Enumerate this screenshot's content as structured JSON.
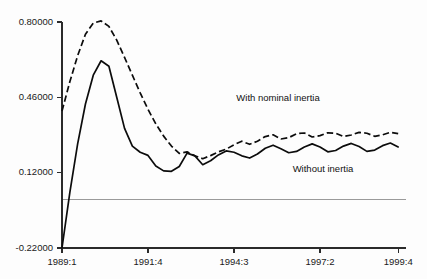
{
  "chart_data": {
    "type": "line",
    "title": "",
    "subtitle": "",
    "xlabel": "",
    "ylabel": "",
    "xlim": [
      0,
      44
    ],
    "ylim": [
      -0.22,
      0.8
    ],
    "grid": false,
    "legend_position": "inline-annotation",
    "zero_line": 0.0,
    "y_ticks": [
      {
        "value": 0.8,
        "label": "0.80000"
      },
      {
        "value": 0.46,
        "label": "0.46000"
      },
      {
        "value": 0.12,
        "label": "0.12000"
      },
      {
        "value": -0.22,
        "label": "-0.22000"
      }
    ],
    "x_ticks": [
      {
        "index": 0,
        "label": "1989:1"
      },
      {
        "index": 11,
        "label": "1991:4"
      },
      {
        "index": 22,
        "label": "1994:3"
      },
      {
        "index": 33,
        "label": "1997:2"
      },
      {
        "index": 43,
        "label": "1999:4"
      }
    ],
    "annotations": [
      {
        "text": "With nominal inertia",
        "series": "with-nominal-inertia",
        "x": 22.3,
        "y": 0.455
      },
      {
        "text": "Without inertia",
        "series": "without-inertia",
        "x": 29.5,
        "y": 0.135
      }
    ],
    "series": [
      {
        "name": "With nominal inertia",
        "style": "dashed",
        "color": "#0c0c0c",
        "x": [
          0,
          1,
          2,
          3,
          4,
          5,
          6,
          7,
          8,
          9,
          10,
          11,
          12,
          13,
          14,
          15,
          16,
          17,
          18,
          19,
          20,
          21,
          22,
          23,
          24,
          25,
          26,
          27,
          28,
          29,
          30,
          31,
          32,
          33,
          34,
          35,
          36,
          37,
          38,
          39,
          40,
          41,
          42,
          43
        ],
        "values": [
          0.398,
          0.53,
          0.648,
          0.745,
          0.795,
          0.805,
          0.78,
          0.718,
          0.64,
          0.56,
          0.48,
          0.406,
          0.34,
          0.285,
          0.24,
          0.207,
          0.214,
          0.196,
          0.183,
          0.197,
          0.214,
          0.226,
          0.246,
          0.262,
          0.248,
          0.262,
          0.283,
          0.291,
          0.272,
          0.278,
          0.296,
          0.299,
          0.281,
          0.287,
          0.3,
          0.298,
          0.283,
          0.29,
          0.302,
          0.298,
          0.284,
          0.291,
          0.302,
          0.296
        ]
      },
      {
        "name": "Without inertia",
        "style": "solid",
        "color": "#0c0c0c",
        "x": [
          0,
          1,
          2,
          3,
          4,
          5,
          6,
          7,
          8,
          9,
          10,
          11,
          12,
          13,
          14,
          15,
          16,
          17,
          18,
          19,
          20,
          21,
          22,
          23,
          24,
          25,
          26,
          27,
          28,
          29,
          30,
          31,
          32,
          33,
          34,
          35,
          36,
          37,
          38,
          39,
          40,
          41,
          42,
          43
        ],
        "values": [
          -0.22,
          0.03,
          0.25,
          0.43,
          0.56,
          0.625,
          0.6,
          0.46,
          0.32,
          0.24,
          0.212,
          0.198,
          0.15,
          0.128,
          0.126,
          0.148,
          0.208,
          0.196,
          0.156,
          0.174,
          0.2,
          0.218,
          0.212,
          0.196,
          0.186,
          0.204,
          0.23,
          0.244,
          0.228,
          0.21,
          0.216,
          0.236,
          0.25,
          0.236,
          0.214,
          0.22,
          0.24,
          0.252,
          0.238,
          0.216,
          0.222,
          0.242,
          0.254,
          0.236
        ]
      }
    ]
  },
  "figure": {
    "background_color": "#fdfdfd",
    "axis_color": "#2b2b2b",
    "zero_line_color": "#9a9a9a"
  }
}
